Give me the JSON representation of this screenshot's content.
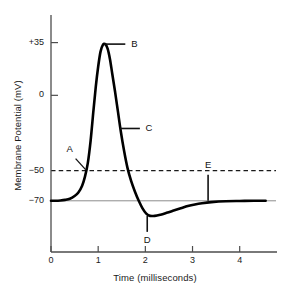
{
  "chart_data": {
    "type": "line",
    "title": "",
    "xlabel": "Time (milliseconds)",
    "ylabel": "Membrane Potential (mV)",
    "xlim": [
      0,
      4.6
    ],
    "ylim": [
      -100,
      50
    ],
    "grid": false,
    "legend": false,
    "xticks": [
      0,
      1,
      2,
      3,
      4
    ],
    "xtick_labels": [
      "0",
      "1",
      "2",
      "3",
      "4"
    ],
    "yticks": [
      35,
      0
    ],
    "ytick_labels": [
      "+35",
      "0"
    ],
    "extra_ytick_labels": [
      "−50",
      "−70"
    ],
    "threshold_mv": -50,
    "resting_mv": -70,
    "peak_mv": 35,
    "trough_mv": -80,
    "series": [
      {
        "name": "Action potential",
        "x": [
          0.0,
          0.1,
          0.2,
          0.3,
          0.4,
          0.5,
          0.58,
          0.66,
          0.72,
          0.78,
          0.84,
          0.9,
          0.95,
          1.0,
          1.05,
          1.1,
          1.15,
          1.2,
          1.25,
          1.3,
          1.36,
          1.42,
          1.48,
          1.55,
          1.62,
          1.7,
          1.78,
          1.86,
          1.94,
          2.02,
          2.1,
          2.2,
          2.32,
          2.45,
          2.6,
          2.75,
          2.9,
          3.05,
          3.2,
          3.4,
          3.7,
          4.0,
          4.3,
          4.55
        ],
        "y": [
          -70.0,
          -70.0,
          -69.8,
          -69.4,
          -68.6,
          -66.8,
          -64.5,
          -60.0,
          -54.0,
          -45.0,
          -30.0,
          -10.0,
          6.0,
          19.0,
          29.0,
          33.5,
          34.0,
          31.0,
          24.0,
          14.0,
          2.0,
          -11.0,
          -24.0,
          -37.0,
          -48.0,
          -57.0,
          -64.0,
          -70.0,
          -75.0,
          -78.5,
          -80.0,
          -80.0,
          -79.2,
          -78.0,
          -76.5,
          -75.0,
          -73.5,
          -72.4,
          -71.6,
          -70.9,
          -70.3,
          -70.1,
          -70.0,
          -70.0
        ]
      }
    ],
    "annotations": [
      {
        "label": "A",
        "x": 0.755,
        "y": -50,
        "note": "threshold"
      },
      {
        "label": "B",
        "x": 1.13,
        "y": 34,
        "note": "peak / depolarization"
      },
      {
        "label": "C",
        "x": 1.46,
        "y": -22,
        "note": "repolarization"
      },
      {
        "label": "D",
        "x": 2.04,
        "y": -80,
        "note": "hyperpolarization"
      },
      {
        "label": "E",
        "x": 3.33,
        "y": -70,
        "note": "resting potential"
      }
    ],
    "colors": {
      "curve": "#000000",
      "axis": "#4d4d4d",
      "threshold_line": "#1a1a1a",
      "resting_line": "#808080",
      "text": "#111111",
      "background": "#ffffff"
    }
  },
  "labels": {
    "A": "A",
    "B": "B",
    "C": "C",
    "D": "D",
    "E": "E"
  },
  "ticks": {
    "y_plus35": "+35",
    "y_zero": "0",
    "y_minus50": "−50",
    "y_minus70": "−70",
    "x0": "0",
    "x1": "1",
    "x2": "2",
    "x3": "3",
    "x4": "4"
  },
  "axes": {
    "x_title": "Time (milliseconds)",
    "y_title": "Membrane Potential (mV)"
  }
}
